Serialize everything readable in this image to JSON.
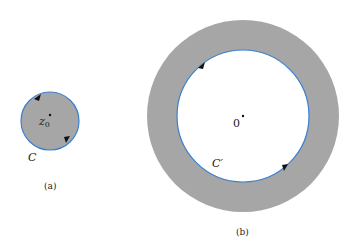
{
  "figure_a": {
    "point_label": "z",
    "point_subscript": "0",
    "contour_label": "C",
    "caption": "(a)",
    "colors": {
      "disk_fill": "#a6a6a6",
      "contour": "#3a7fd0"
    }
  },
  "figure_b": {
    "origin_label": "0",
    "contour_label": "C′",
    "caption": "(b)",
    "colors": {
      "annulus_fill": "#a6a6a6",
      "contour": "#3a7fd0",
      "inner_fill": "#ffffff"
    }
  }
}
